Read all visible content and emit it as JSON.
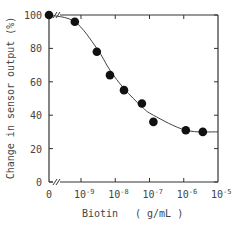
{
  "chart_data": {
    "type": "scatter",
    "title": "",
    "xlabel": "Biotin  ( g/mL )",
    "ylabel": "Change in sensor output (%)",
    "x_scale": "log (with broken axis at 0)",
    "x_ticks": [
      "0",
      "10^-9",
      "10^-8",
      "10^-7",
      "10^-6",
      "10^-5"
    ],
    "y_ticks": [
      "0",
      "20",
      "40",
      "60",
      "80",
      "100"
    ],
    "ylim": [
      0,
      100
    ],
    "xlim_log10": [
      -9.2,
      -5
    ],
    "grid": false,
    "legend": null,
    "series": [
      {
        "name": "measured",
        "marker": "filled-circle",
        "points": [
          {
            "x": 0,
            "y": 100
          },
          {
            "x": 6.6e-10,
            "y": 96
          },
          {
            "x": 2.9e-09,
            "y": 78
          },
          {
            "x": 7e-09,
            "y": 64
          },
          {
            "x": 1.8e-08,
            "y": 55
          },
          {
            "x": 6e-08,
            "y": 47
          },
          {
            "x": 1.3e-07,
            "y": 36
          },
          {
            "x": 1.15e-06,
            "y": 31
          },
          {
            "x": 3.6e-06,
            "y": 30
          }
        ]
      },
      {
        "name": "fitted-curve",
        "marker": "none",
        "line": "solid",
        "points": [
          {
            "x": 0,
            "y": 100
          },
          {
            "x": 6.6e-10,
            "y": 96
          },
          {
            "x": 2.9e-09,
            "y": 80
          },
          {
            "x": 7e-09,
            "y": 67
          },
          {
            "x": 1.8e-08,
            "y": 56
          },
          {
            "x": 6e-08,
            "y": 45
          },
          {
            "x": 1.3e-07,
            "y": 40
          },
          {
            "x": 1.15e-06,
            "y": 31
          },
          {
            "x": 1e-05,
            "y": 30
          }
        ]
      }
    ]
  },
  "labels": {
    "y_axis_title": "Change in sensor output (%)",
    "x_axis_title": "Biotin",
    "x_axis_unit": "( g/mL )",
    "x_tick_zero": "0",
    "x_tick_base": "10",
    "x_tick_exps": [
      "-9",
      "-8",
      "-7",
      "-6",
      "-5"
    ],
    "y_tick_labels": [
      "100",
      "80",
      "60",
      "40",
      "20",
      "0"
    ]
  }
}
